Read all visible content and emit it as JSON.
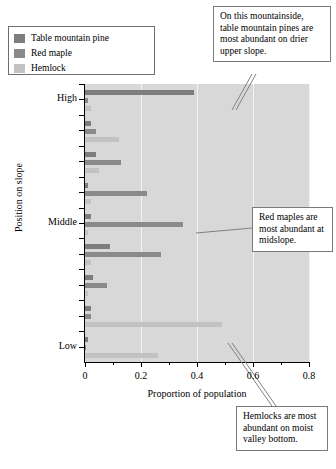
{
  "legend": {
    "items": [
      {
        "label": "Table mountain pine",
        "color": "#7d7d7d"
      },
      {
        "label": "Red maple",
        "color": "#8a8a8a"
      },
      {
        "label": "Hemlock",
        "color": "#c2c2c2"
      }
    ]
  },
  "annotations": [
    {
      "id": "pine",
      "text": "On this mountainside, table mountain pines are most abundant on drier upper slope."
    },
    {
      "id": "maple",
      "text": "Red maples are most abundant at midslope."
    },
    {
      "id": "hemlock",
      "text": "Hemlocks are most abundant on moist valley bottom."
    }
  ],
  "chart_data": {
    "type": "bar",
    "orientation": "horizontal",
    "title": "",
    "xlabel": "Proportion of population",
    "ylabel": "Position on slope",
    "xlim": [
      0,
      0.8
    ],
    "xticks": [
      0,
      0.2,
      0.4,
      0.6,
      0.8
    ],
    "xticklabels": [
      "0",
      "0.2",
      "0.4",
      "0.6",
      "0.8"
    ],
    "grid": true,
    "grid_axis": "x",
    "legend_position": "upper-left-outside",
    "categories": [
      "Position 9 (highest)",
      "Position 8",
      "Position 7",
      "Position 6",
      "Position 5 (middle)",
      "Position 4",
      "Position 3",
      "Position 2",
      "Position 1 (lowest)"
    ],
    "category_axis_labels": [
      {
        "label": "High",
        "category_index": 8
      },
      {
        "label": "Middle",
        "category_index": 4
      },
      {
        "label": "Low",
        "category_index": 0
      }
    ],
    "series": [
      {
        "name": "Table mountain pine",
        "color": "#7d7d7d",
        "values": [
          0.01,
          0.02,
          0.03,
          0.09,
          0.02,
          0.01,
          0.04,
          0.02,
          0.39
        ]
      },
      {
        "name": "Red maple",
        "color": "#8a8a8a",
        "values": [
          0.0,
          0.02,
          0.08,
          0.27,
          0.35,
          0.22,
          0.13,
          0.04,
          0.01
        ]
      },
      {
        "name": "Hemlock",
        "color": "#c2c2c2",
        "values": [
          0.26,
          0.49,
          0.01,
          0.02,
          0.01,
          0.02,
          0.05,
          0.12,
          0.02
        ]
      }
    ]
  }
}
